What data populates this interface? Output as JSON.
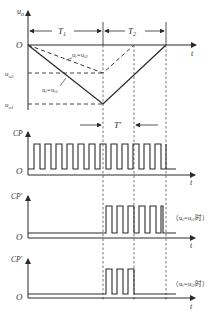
{
  "diagram": {
    "type": "timing-diagram",
    "colors": {
      "line": "#2a2a2a",
      "dashed": "#444444",
      "background": "#ffffff"
    },
    "panel_top": {
      "y_axis_label": "u",
      "y_axis_sub": "o",
      "x_axis_label": "t",
      "origin_label": "O",
      "interval_1": {
        "label": "T",
        "sub": "1"
      },
      "interval_2": {
        "label": "T",
        "sub": "2"
      },
      "level_u02": {
        "label": "u",
        "sub": "o2"
      },
      "level_u01": {
        "label": "u",
        "sub": "o1"
      },
      "curve_dashed_label": "uᵢ=uᵢ2",
      "curve_dashed_label_main": "u",
      "curve_dashed_label_sub1": "i",
      "curve_dashed_label_eq": "=u",
      "curve_dashed_label_sub2": "i2",
      "curve_solid_label_main": "u",
      "curve_solid_label_sub1": "i",
      "curve_solid_label_eq": "=u",
      "curve_solid_label_sub2": "i1"
    },
    "gate_interval": {
      "label": "T′"
    },
    "panel_cp": {
      "y_axis_label": "CP",
      "x_axis_label": "t",
      "origin_label": "O",
      "pulse_count": 12
    },
    "panel_cp1": {
      "y_axis_label": "CP′",
      "x_axis_label": "t",
      "origin_label": "O",
      "pulse_count": 4,
      "note": "（u",
      "note_sub1": "i",
      "note_eq": "=u",
      "note_sub2": "i1",
      "note_end": "时）"
    },
    "panel_cp2": {
      "y_axis_label": "CP′",
      "x_axis_label": "t",
      "origin_label": "O",
      "pulse_count": 3,
      "note": "（u",
      "note_sub1": "i",
      "note_eq": "=u",
      "note_sub2": "i2",
      "note_end": "时）"
    }
  }
}
